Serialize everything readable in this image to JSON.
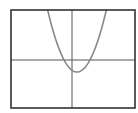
{
  "chart_data": {
    "type": "line",
    "title": "",
    "xlabel": "",
    "ylabel": "",
    "grid": false,
    "legend": null,
    "function": "y = a*(x - h)^2 + k",
    "params": {
      "a": 0.72,
      "h": 0.5,
      "k": -1.2
    },
    "xlim": [
      -6.1,
      6.3
    ],
    "ylim": [
      -4.8,
      5.0
    ],
    "vertex": [
      0.5,
      -1.2
    ],
    "roots": [
      -1.3,
      2.3
    ],
    "series": [
      {
        "name": "parabola",
        "x": [
          -3.4,
          -3.0,
          -2.5,
          -2.0,
          -1.5,
          -1.0,
          -0.5,
          0.0,
          0.5,
          1.0,
          1.5,
          2.0,
          2.5,
          3.0,
          3.5,
          4.0,
          4.4
        ],
        "y": [
          9.75,
          7.62,
          5.28,
          3.3,
          1.68,
          0.42,
          -0.48,
          -1.02,
          -1.2,
          -1.02,
          -0.48,
          0.42,
          1.68,
          3.3,
          5.28,
          7.62,
          9.75
        ]
      }
    ]
  },
  "style": {
    "frame_color": "#333333",
    "axis_color": "#555555",
    "curve_color": "#888888",
    "background": "#ffffff"
  }
}
